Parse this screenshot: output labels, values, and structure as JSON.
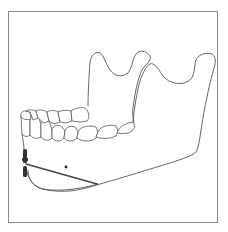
{
  "figure": {
    "elements": [
      {
        "name": "frame-border"
      },
      {
        "name": "mandible-outline"
      },
      {
        "name": "coronoid-process"
      },
      {
        "name": "condylar-process"
      },
      {
        "name": "lower-dentition"
      },
      {
        "name": "upper-dentition"
      },
      {
        "name": "osteotomy-line"
      },
      {
        "name": "fixation-marks"
      },
      {
        "name": "mental-foramen-dot"
      }
    ],
    "colors": {
      "line": "#555555",
      "frame": "#8a8a8a",
      "background": "#ffffff",
      "cut": "#444444"
    }
  }
}
